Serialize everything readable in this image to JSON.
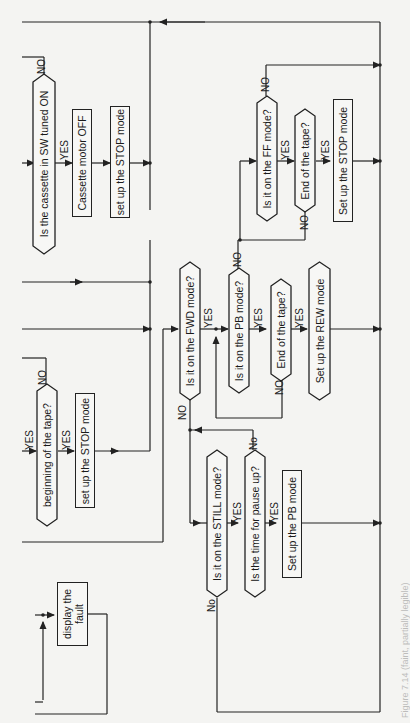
{
  "diagram": {
    "orientation": "rotated-90-ccw",
    "colors": {
      "line": "#222222",
      "background": "#f4f4f2"
    },
    "nodes": {
      "cassette_sw_decision": {
        "type": "decision",
        "text": "Is the cassette in SW tuned ON"
      },
      "cassette_motor_off": {
        "type": "process",
        "text": "Cassette motor OFF"
      },
      "stop_mode_1": {
        "type": "process",
        "text": "set up the STOP mode"
      },
      "beginning_tape_decision": {
        "type": "decision",
        "text": "beginning of the tape?"
      },
      "stop_mode_2": {
        "type": "process",
        "text": "set up the STOP mode"
      },
      "display_fault": {
        "type": "process",
        "text": "display the fault"
      },
      "fwd_mode_decision": {
        "type": "decision",
        "text": "Is it on the FWD mode?"
      },
      "pb_mode_decision": {
        "type": "decision",
        "text": "Is it on the PB mode?"
      },
      "end_tape_decision_1": {
        "type": "decision",
        "text": "End of the tape?"
      },
      "rew_mode": {
        "type": "decision-shape-process",
        "text": "Set up the REW mode"
      },
      "ff_mode_decision": {
        "type": "decision",
        "text": "Is it on the FF mode?"
      },
      "end_tape_decision_2": {
        "type": "decision",
        "text": "End of the tape?"
      },
      "stop_mode_3": {
        "type": "process",
        "text": "Set up the STOP mode"
      },
      "still_mode_decision": {
        "type": "decision",
        "text": "Is it on the STILL mode?"
      },
      "pause_time_decision": {
        "type": "decision",
        "text": "Is the time for pause up?"
      },
      "pb_mode": {
        "type": "process",
        "text": "Set up the PB mode"
      }
    },
    "edge_labels": {
      "yes": "YES",
      "no_upper": "NO",
      "no_mixed": "No"
    },
    "caption": "Figure 7.14 (faint, partially legible)"
  }
}
